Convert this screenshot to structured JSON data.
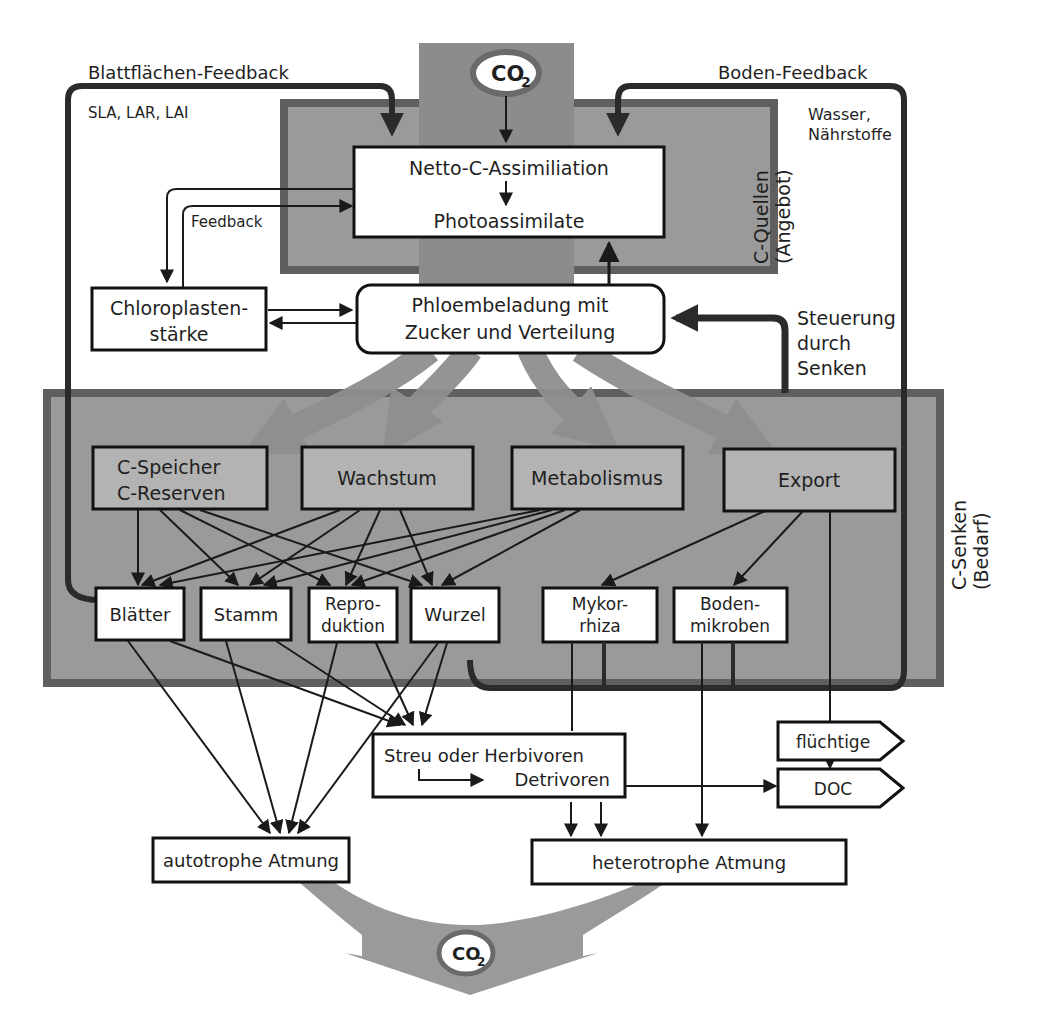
{
  "co2_top": {
    "main": "CO",
    "sub": "2"
  },
  "co2_bottom": {
    "main": "CO",
    "sub": "2"
  },
  "labels": {
    "leaf_feedback": "Blattflächen-Feedback",
    "leaf_params": "SLA, LAR, LAI",
    "soil_feedback": "Boden-Feedback",
    "water_line1": "Wasser,",
    "water_line2": "Nährstoffe",
    "feedback": "Feedback",
    "sources_line1": "C-Quellen",
    "sources_line2": "(Angebot)",
    "sinks_line1": "C-Senken",
    "sinks_line2": "(Bedarf)",
    "control_line1": "Steuerung",
    "control_line2": "durch",
    "control_line3": "Senken"
  },
  "nodes": {
    "assimilation": {
      "line1": "Netto-C-Assimiliation",
      "line2": "Photoassimilate"
    },
    "chloroplast": {
      "line1": "Chloroplasten-",
      "line2": "stärke"
    },
    "phloem": {
      "line1": "Phloembeladung mit",
      "line2": "Zucker und Verteilung"
    },
    "storage": {
      "line1": "C-Speicher",
      "line2": "C-Reserven"
    },
    "growth": {
      "label": "Wachstum"
    },
    "metabolism": {
      "label": "Metabolismus"
    },
    "export": {
      "label": "Export"
    },
    "leaves": {
      "label": "Blätter"
    },
    "stem": {
      "label": "Stamm"
    },
    "reproduction": {
      "line1": "Repro-",
      "line2": "duktion"
    },
    "root": {
      "label": "Wurzel"
    },
    "mycorrhiza": {
      "line1": "Mykor-",
      "line2": "rhiza"
    },
    "soil_microbes": {
      "line1": "Boden-",
      "line2": "mikroben"
    },
    "litter": {
      "line1": "Streu oder Herbivoren",
      "line2": "Detrivoren"
    },
    "volatile": {
      "label": "flüchtige"
    },
    "doc": {
      "label": "DOC"
    },
    "autotrophic": {
      "label": "autotrophe Atmung"
    },
    "heterotrophic": {
      "label": "heterotrophe Atmung"
    }
  },
  "colors": {
    "panel_fill": "#9a9a9a",
    "panel_border": "#5f5f5f",
    "sink_box_fill": "#b3b3b3",
    "flow_arrow": "#8f8f8f",
    "feedback_line": "#2b2b2b",
    "co2_ring": "#6a6a6a"
  }
}
